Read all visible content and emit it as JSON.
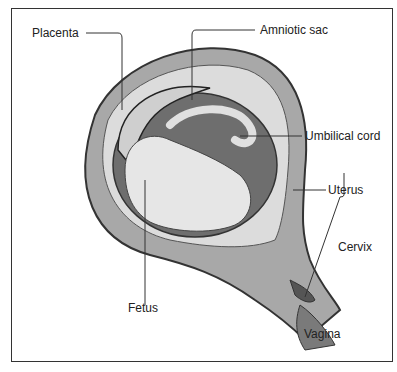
{
  "figure": {
    "labels": {
      "placenta": "Placenta",
      "amniotic_sac": "Amniotic sac",
      "umbilical_cord": "Umbilical cord",
      "uterus": "Uterus",
      "cervix": "Cervix",
      "fetus": "Fetus",
      "vagina": "Vagina"
    }
  },
  "colors": {
    "line": "#333333",
    "uterus_wall": "#a8a8a8",
    "sac_fluid": "#6e6e6e",
    "fetus": "#e6e6e6",
    "background": "#ffffff"
  }
}
